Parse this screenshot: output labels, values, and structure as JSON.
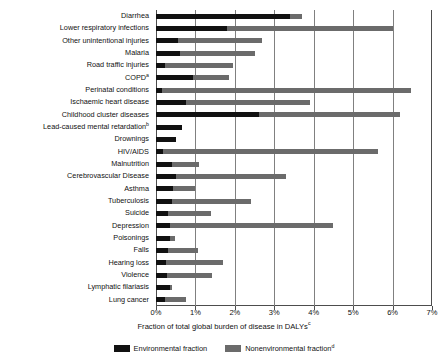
{
  "chart_data": {
    "type": "bar",
    "orientation": "horizontal",
    "stacked": true,
    "title": "",
    "xlabel": "Fraction of total global burden of disease in DALYs",
    "xlabel_footnote": "c",
    "ylabel": "",
    "xlim": [
      0,
      7
    ],
    "xunit": "%",
    "xticks": [
      0,
      1,
      2,
      3,
      4,
      5,
      6,
      7
    ],
    "xtick_labels": [
      "0%",
      "1%",
      "2%",
      "3%",
      "4%",
      "5%",
      "6%",
      "7%"
    ],
    "grid": "vertical",
    "legend_position": "bottom",
    "categories": [
      "Diarrhea",
      "Lower respiratory infections",
      "Other unintentional injuries",
      "Malaria",
      "Road traffic injuries",
      "COPD",
      "Perinatal conditions",
      "Ischaemic heart disease",
      "Childhood cluster diseases",
      "Lead-caused mental retardation",
      "Drownings",
      "HIV/AIDS",
      "Malnutrition",
      "Cerebrovascular Disease",
      "Asthma",
      "Tuberculosis",
      "Suicide",
      "Depression",
      "Poisonings",
      "Falls",
      "Hearing loss",
      "Violence",
      "Lymphatic filariasis",
      "Lung cancer"
    ],
    "category_footnotes": {
      "COPD": "a",
      "Lead-caused mental retardation": "b"
    },
    "series": [
      {
        "name": "Environmental fraction",
        "color": "#111111",
        "values": [
          3.4,
          1.8,
          0.55,
          0.6,
          0.22,
          0.95,
          0.16,
          0.75,
          2.6,
          0.65,
          0.5,
          0.18,
          0.4,
          0.5,
          0.42,
          0.4,
          0.3,
          0.35,
          0.35,
          0.3,
          0.26,
          0.28,
          0.35,
          0.22
        ]
      },
      {
        "name": "Nonenvironmental fraction",
        "color": "#6b6b6b",
        "footnote": "d",
        "values": [
          0.3,
          4.2,
          2.15,
          1.9,
          1.73,
          0.9,
          6.3,
          3.15,
          3.6,
          0.0,
          0.0,
          5.45,
          0.7,
          2.8,
          0.58,
          2.0,
          1.1,
          4.15,
          0.13,
          0.77,
          1.45,
          1.13,
          0.05,
          0.53
        ]
      }
    ],
    "totals": [
      3.7,
      6.0,
      2.7,
      2.5,
      1.95,
      1.85,
      6.46,
      3.9,
      6.2,
      0.65,
      0.5,
      5.63,
      1.1,
      3.3,
      1.0,
      2.4,
      1.4,
      4.5,
      0.48,
      1.07,
      1.71,
      1.41,
      0.4,
      0.75
    ]
  },
  "legend": {
    "items": [
      {
        "label": "Environmental fraction",
        "footnote": "",
        "swatch": "environmental-swatch"
      },
      {
        "label": "Nonenvironmental fraction",
        "footnote": "d",
        "swatch": "nonenvironmental-swatch"
      }
    ]
  }
}
